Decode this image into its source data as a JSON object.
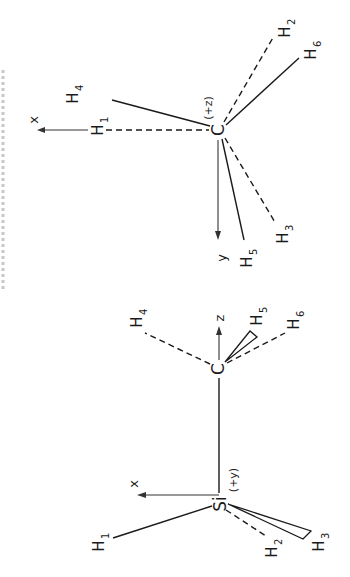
{
  "caption_fragment": {
    "text": "",
    "note_visible": "partial rotated caption cut off at left edge, illegible"
  },
  "upper_molecule": {
    "central_atom": "C",
    "central_atom_note": "(+z)",
    "axes": [
      {
        "label": "x",
        "direction": "left"
      },
      {
        "label": "y",
        "direction": "down"
      }
    ],
    "hydrogens": [
      {
        "label": "H",
        "index": "1",
        "bond": "dashed"
      },
      {
        "label": "H",
        "index": "2",
        "bond": "dashed"
      },
      {
        "label": "H",
        "index": "3",
        "bond": "dashed"
      },
      {
        "label": "H",
        "index": "4",
        "bond": "solid"
      },
      {
        "label": "H",
        "index": "5",
        "bond": "solid"
      },
      {
        "label": "H",
        "index": "6",
        "bond": "solid"
      }
    ]
  },
  "lower_molecule": {
    "atoms": [
      {
        "label": "C"
      },
      {
        "label": "Si",
        "note": "(+y)"
      }
    ],
    "axes": [
      {
        "label": "z",
        "direction": "up"
      },
      {
        "label": "x",
        "direction": "left"
      }
    ],
    "hydrogens": [
      {
        "label": "H",
        "index": "1",
        "bond": "solid"
      },
      {
        "label": "H",
        "index": "2",
        "bond": "dashed"
      },
      {
        "label": "H",
        "index": "3",
        "bond": "wedge"
      },
      {
        "label": "H",
        "index": "4",
        "bond": "dashed"
      },
      {
        "label": "H",
        "index": "5",
        "bond": "wedge"
      },
      {
        "label": "H",
        "index": "6",
        "bond": "dashed"
      }
    ]
  },
  "colors": {
    "ink": "#1a1a1a",
    "background": "#ffffff"
  }
}
